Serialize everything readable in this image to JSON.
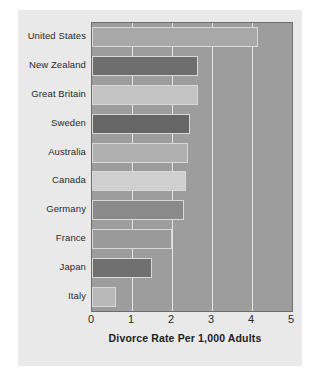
{
  "chart_data": {
    "type": "bar",
    "orientation": "horizontal",
    "title": "",
    "xlabel": "Divorce Rate Per 1,000 Adults",
    "ylabel": "",
    "xlim": [
      0,
      5
    ],
    "xticks": [
      "0",
      "1",
      "2",
      "3",
      "4",
      "5"
    ],
    "grid": true,
    "legend": "none",
    "categories": [
      "United States",
      "New Zealand",
      "Great Britain",
      "Sweden",
      "Australia",
      "Canada",
      "Germany",
      "France",
      "Japan",
      "Italy"
    ],
    "values": [
      4.15,
      2.65,
      2.65,
      2.45,
      2.4,
      2.35,
      2.3,
      2.0,
      1.5,
      0.6
    ],
    "bar_colors": [
      "#a8a8a8",
      "#6e6e6e",
      "#c3c3c3",
      "#666666",
      "#b0b0b0",
      "#cfcfcf",
      "#8a8a8a",
      "#9a9a9a",
      "#707070",
      "#b9b9b9"
    ],
    "plot_background": "#9d9d9d",
    "panel_background": "#e9e9e9",
    "gridline_color": "#e4e4e4",
    "axis_color": "#6d6d6d"
  }
}
